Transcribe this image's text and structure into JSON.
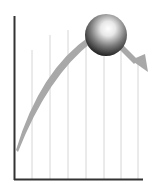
{
  "diagram": {
    "title": "",
    "axes": {
      "y_axis": {
        "x": 14.5,
        "top": 16,
        "bottom": 180
      },
      "x_axis": {
        "y": 179.5,
        "left": 14,
        "right": 143
      }
    },
    "gridlines_x": [
      32,
      50,
      68,
      86,
      104,
      121,
      138
    ],
    "colors": {
      "axis": "#333333",
      "grid": "#d6d6d6",
      "curve": "#a8a8a8",
      "ball_dark": "#111111",
      "ball_light": "#ffffff"
    },
    "ball": {
      "cx": 106,
      "cy": 35,
      "r": 21
    },
    "icons": [
      "ball-icon",
      "arrow-icon"
    ]
  }
}
